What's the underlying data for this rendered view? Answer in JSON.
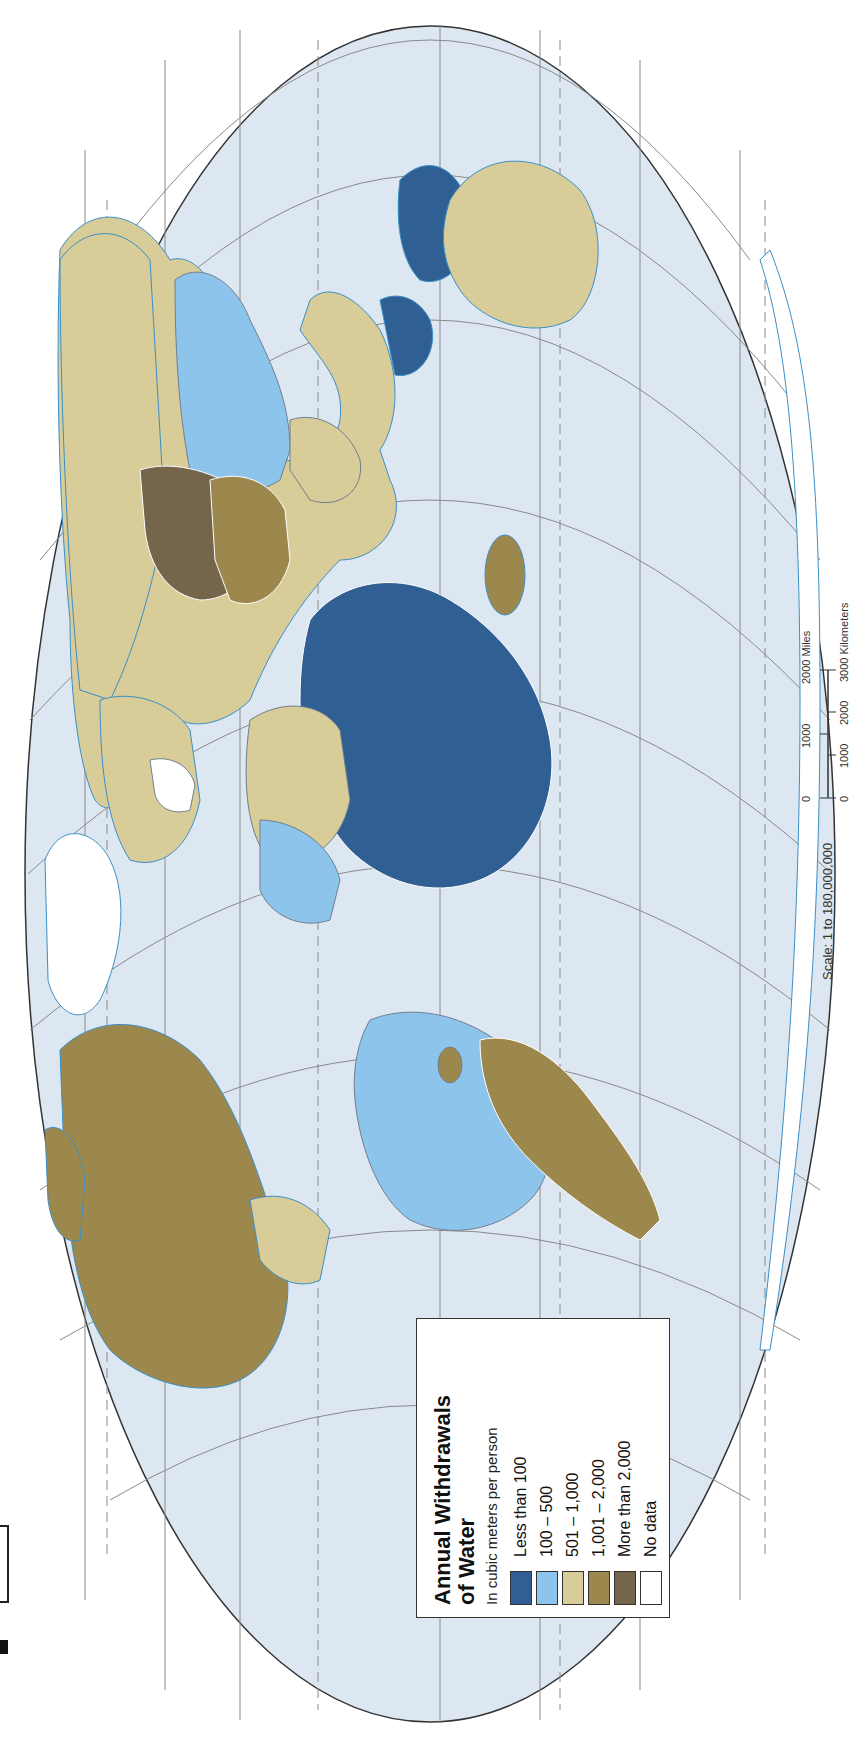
{
  "map": {
    "title": "Annual Withdrawals of Water",
    "title_line1": "Annual Withdrawals",
    "title_line2": "of Water",
    "subtitle": "In cubic meters per person",
    "orientation": "rotated 90° counter-clockwise",
    "colors": {
      "ocean": "#dce7f1",
      "graticule": "#8a8a8a",
      "coastline": "#3a8fc8",
      "border": "#ffffff"
    }
  },
  "legend": {
    "items": [
      {
        "label": "Less than 100",
        "color": "#2f5f93"
      },
      {
        "label": "100 – 500",
        "color": "#8cc4ec"
      },
      {
        "label": "501 – 1,000",
        "color": "#d8cc98"
      },
      {
        "label": "1,001 – 2,000",
        "color": "#9c874c"
      },
      {
        "label": "More than 2,000",
        "color": "#75654a"
      },
      {
        "label": "No data",
        "color": "#ffffff"
      }
    ]
  },
  "scale": {
    "text": "Scale:  1 to 180,000,000",
    "miles_ticks": [
      "0",
      "1000",
      "2000 Miles"
    ],
    "km_ticks": [
      "0",
      "1000",
      "2000",
      "3000 Kilometers"
    ]
  }
}
